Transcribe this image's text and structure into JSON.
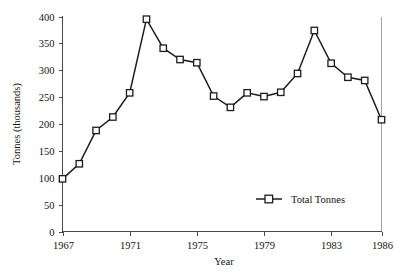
{
  "chart_data": {
    "type": "line",
    "title": "",
    "xlabel": "Year",
    "ylabel": "Tonnes (thousands)",
    "xlim": [
      1967,
      1986
    ],
    "ylim": [
      0,
      400
    ],
    "grid": false,
    "legend_position": "inside-bottom-right",
    "x_tick_labels": [
      "1967",
      "1971",
      "1975",
      "1979",
      "1983",
      "1986"
    ],
    "x_tick_values": [
      1967,
      1971,
      1975,
      1979,
      1983,
      1986
    ],
    "y_tick_labels": [
      "0",
      "50",
      "100",
      "150",
      "200",
      "250",
      "300",
      "350",
      "400"
    ],
    "y_tick_values": [
      0,
      50,
      100,
      150,
      200,
      250,
      300,
      350,
      400
    ],
    "x": [
      1967,
      1968,
      1969,
      1970,
      1971,
      1972,
      1973,
      1974,
      1975,
      1976,
      1977,
      1978,
      1979,
      1980,
      1981,
      1982,
      1983,
      1984,
      1985,
      1986
    ],
    "series": [
      {
        "name": "Total Tonnes",
        "marker": "open-square",
        "color": "#1c1c1c",
        "values": [
          98,
          126,
          188,
          213,
          258,
          395,
          341,
          320,
          314,
          252,
          231,
          258,
          251,
          259,
          294,
          374,
          313,
          287,
          281,
          208
        ]
      }
    ],
    "legend": [
      {
        "label": "Total Tonnes",
        "marker": "open-square",
        "color": "#1c1c1c"
      }
    ]
  },
  "colors": {
    "axis": "#4a4a4a",
    "series": "#1c1c1c",
    "marker_fill": "#ffffff",
    "top_rule_left": "#8b7d6b",
    "top_rule_right": "#8fb9d8",
    "right_rule": "#9aa6b5",
    "background": "#ffffff"
  }
}
